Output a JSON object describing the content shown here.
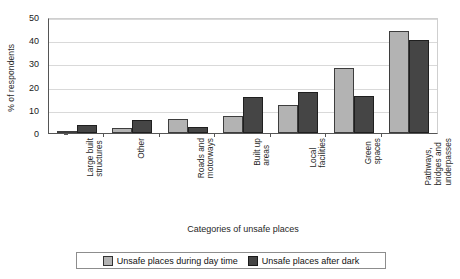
{
  "chart_data": {
    "type": "bar",
    "title": "",
    "xlabel": "Categories of unsafe places",
    "ylabel": "% of respondents",
    "ylim": [
      0,
      50
    ],
    "yticks": [
      0,
      10,
      20,
      30,
      40,
      50
    ],
    "grid": true,
    "legend_position": "bottom",
    "categories": [
      "Large built\nstructures",
      "Other",
      "Roads and\nmotorways",
      "Built up\nareas",
      "Local\nfacilities",
      "Green\nspaces",
      "Pathways,\nbridges and\nunderpasses"
    ],
    "series": [
      {
        "name": "Unsafe places during day time",
        "color": "#b3b3b3",
        "values": [
          1,
          2,
          6,
          7.5,
          12,
          28,
          44
        ]
      },
      {
        "name": "Unsafe places after dark",
        "color": "#454545",
        "values": [
          3.5,
          5.5,
          2.5,
          15.5,
          17.5,
          16,
          40
        ]
      }
    ]
  },
  "axes": {
    "y_title": "% of respondents",
    "x_title": "Categories of unsafe places",
    "y_tick_labels": [
      "0",
      "10",
      "20",
      "30",
      "40",
      "50"
    ]
  },
  "legend": {
    "items": [
      {
        "label": "Unsafe places during day time",
        "swatch": "light"
      },
      {
        "label": "Unsafe places after dark",
        "swatch": "dark"
      }
    ]
  }
}
